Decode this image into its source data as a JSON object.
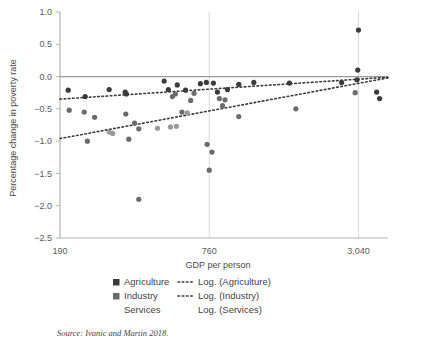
{
  "figure": {
    "source_note": "Source: Ivanic and Martin 2018."
  },
  "chart_data": {
    "type": "scatter",
    "title": "",
    "xlabel": "GDP per person",
    "ylabel": "Percentage change in poverty rate",
    "x_scale": "log",
    "x_ticks": [
      190,
      760,
      3040
    ],
    "x_tick_labels": [
      "190",
      "760",
      "3,040"
    ],
    "xlim": [
      190,
      4000
    ],
    "y_ticks": [
      1.0,
      0.5,
      0.0,
      -0.5,
      -1.0,
      -1.5,
      -2.0,
      -2.5
    ],
    "y_tick_labels": [
      "1.0",
      "0.5",
      "0.0",
      "−0.5",
      "−1.0",
      "−1.5",
      "−2.0",
      "−2.5"
    ],
    "ylim": [
      -2.5,
      1.0
    ],
    "grid": true,
    "zero_reference_line": 0.0,
    "legend_position": "bottom",
    "colors": {
      "agriculture": "#3b3b3b",
      "industry": "#6b6b6b",
      "services": "#9a9a9a",
      "zero_line": "#9a9a9a",
      "grid": "#d9d9d9"
    },
    "series": [
      {
        "name": "Agriculture",
        "marker": "square",
        "color": "#3b3b3b",
        "points": [
          [
            205,
            -0.21
          ],
          [
            240,
            -0.31
          ],
          [
            300,
            -0.2
          ],
          [
            348,
            -0.24
          ],
          [
            352,
            -0.27
          ],
          [
            500,
            -0.07
          ],
          [
            520,
            -0.2
          ],
          [
            565,
            -0.13
          ],
          [
            610,
            -0.21
          ],
          [
            700,
            -0.11
          ],
          [
            740,
            -0.09
          ],
          [
            790,
            -0.1
          ],
          [
            820,
            -0.24
          ],
          [
            900,
            -0.2
          ],
          [
            1000,
            -0.12
          ],
          [
            1150,
            -0.09
          ],
          [
            1600,
            -0.1
          ],
          [
            2600,
            -0.09
          ],
          [
            3000,
            -0.05
          ],
          [
            3020,
            0.1
          ],
          [
            3040,
            0.72
          ],
          [
            3600,
            -0.24
          ],
          [
            3700,
            -0.34
          ]
        ]
      },
      {
        "name": "Industry",
        "marker": "square",
        "color": "#6b6b6b",
        "points": [
          [
            207,
            -0.52
          ],
          [
            238,
            -0.55
          ],
          [
            245,
            -1.0
          ],
          [
            262,
            -0.63
          ],
          [
            350,
            -0.58
          ],
          [
            360,
            -0.97
          ],
          [
            380,
            -0.72
          ],
          [
            395,
            -0.81
          ],
          [
            540,
            -0.31
          ],
          [
            555,
            -0.27
          ],
          [
            590,
            -0.55
          ],
          [
            640,
            -0.37
          ],
          [
            660,
            -0.26
          ],
          [
            745,
            -1.05
          ],
          [
            760,
            -1.45
          ],
          [
            780,
            -1.17
          ],
          [
            835,
            -0.34
          ],
          [
            860,
            -0.45
          ],
          [
            880,
            -0.36
          ],
          [
            1000,
            -0.62
          ],
          [
            395,
            -1.9
          ],
          [
            1700,
            -0.5
          ],
          [
            2950,
            -0.25
          ]
        ]
      },
      {
        "name": "Services",
        "marker": "none",
        "color": "#9a9a9a",
        "points": [
          [
            300,
            -0.86
          ],
          [
            310,
            -0.88
          ],
          [
            470,
            -0.8
          ],
          [
            530,
            -0.78
          ],
          [
            560,
            -0.77
          ],
          [
            620,
            -0.56
          ]
        ]
      }
    ],
    "trendlines": [
      {
        "name": "Log. (Agriculture)",
        "style": "dotted",
        "color": "#3b3b3b",
        "y_start": -0.35,
        "y_end": -0.01
      },
      {
        "name": "Log. (Industry)",
        "style": "dotted",
        "color": "#3b3b3b",
        "y_start": -0.96,
        "y_end": -0.02
      },
      {
        "name": "Log. (Services)",
        "style": "none",
        "color": "#9a9a9a",
        "y_start": null,
        "y_end": null
      }
    ],
    "legend": [
      {
        "marker_label": "Agriculture",
        "marker": "square",
        "marker_color": "#3b3b3b",
        "line_label": "Log. (Agriculture)",
        "line_style": "dotted"
      },
      {
        "marker_label": "Industry",
        "marker": "square",
        "marker_color": "#6b6b6b",
        "line_label": "Log. (Industry)",
        "line_style": "dotted"
      },
      {
        "marker_label": "Services",
        "marker": "none",
        "marker_color": "#9a9a9a",
        "line_label": "Log. (Services)",
        "line_style": "none"
      }
    ]
  }
}
